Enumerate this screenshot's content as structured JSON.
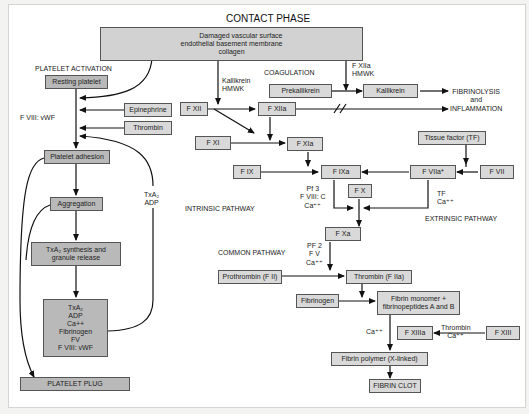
{
  "title": "CONTACT PHASE",
  "colors": {
    "box_fill": "#d9d9d9",
    "box_fill_dark": "#b9b9b9",
    "line": "#111111",
    "background": "#ffffff"
  },
  "source": {
    "line1": "Damaged vascular surface",
    "line2": "endothelial basement membrane",
    "line3": "collagen"
  },
  "section_labels": {
    "platelet_activation": "PLATELET ACTIVATION",
    "coagulation": "COAGULATION",
    "intrinsic": "INTRINSIC PATHWAY",
    "extrinsic": "EXTRINSIC PATHWAY",
    "common": "COMMON PATHWAY"
  },
  "platelet": {
    "resting": "Resting platelet",
    "epinephrine": "Epinephrine",
    "thrombin": "Thrombin",
    "fviii_vwf_label": "F VIII: vWF",
    "adhesion": "Platelet adhesion",
    "aggregation": "Aggregation",
    "txa2_adp_label": [
      "TxA₂",
      "ADP"
    ],
    "synthesis": [
      "TxA₂ synthesis and",
      "granule release"
    ],
    "granules": [
      "TxA₂",
      "ADP",
      "Ca++",
      "Fibrinogen",
      "FV",
      "F VIII: vWF"
    ],
    "plug": "PLATELET PLUG"
  },
  "coag": {
    "kallikrein_hmwk": [
      "Kallikrein",
      "HMWK"
    ],
    "fxiia_hmwk": [
      "F XIIa",
      "HMWK"
    ],
    "prekallikrein": "Prekallikrein",
    "kallikrein": "Kallikrein",
    "fibrinolysis": [
      "FIBRINOLYSIS",
      "and",
      "INFLAMMATION"
    ],
    "fxii": "F XII",
    "fxiia": "F XIIa",
    "fxi": "F XI",
    "fxia": "F XIa",
    "fix": "F IX",
    "fixa": "F IXa",
    "tissue_factor": "Tissue factor (TF)",
    "fviia": "F VIIa*",
    "fvii": "F VII",
    "tenase_cofactors": [
      "Pf 3",
      "F VIII: C",
      "Ca⁺⁺"
    ],
    "tf_ca": [
      "TF",
      "Ca⁺⁺"
    ],
    "fx": "F X",
    "fxa": "F Xa",
    "prothrombinase_cofactors": [
      "PF 2",
      "F V",
      "Ca⁺⁺"
    ],
    "prothrombin": "Prothrombin (F II)",
    "thrombin": "Thrombin (F IIa)",
    "fibrinogen": "Fibrinogen",
    "fibrin_monomer": [
      "Fibrin monomer +",
      "fibrinopeptides A and B"
    ],
    "ca_label": "Ca⁺⁺",
    "fxiiia": "F XIIIa",
    "thrombin_ca": [
      "Thrombin",
      "Ca⁺⁺"
    ],
    "fxiii": "F XIII",
    "fibrin_polymer": "Fibrin polymer (X-linked)",
    "fibrin_clot": "FIBRIN CLOT"
  }
}
